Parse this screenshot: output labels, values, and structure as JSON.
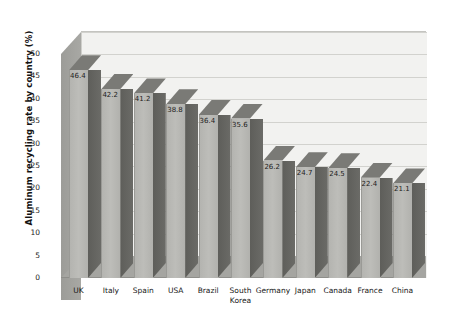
{
  "chart_data": {
    "type": "bar",
    "title": "",
    "xlabel": "",
    "ylabel": "Aluminum recycling rate by country (%)",
    "ylim": [
      0,
      50
    ],
    "yticks": [
      0,
      5,
      10,
      15,
      20,
      25,
      30,
      35,
      40,
      45,
      50
    ],
    "grid": true,
    "legend": false,
    "three_d": true,
    "categories": [
      "UK",
      "Italy",
      "Spain",
      "USA",
      "Brazil",
      "South Korea",
      "Germany",
      "Japan",
      "Canada",
      "France",
      "China"
    ],
    "values": [
      46.4,
      42.2,
      41.2,
      38.8,
      36.4,
      35.6,
      26.2,
      24.7,
      24.5,
      22.4,
      21.1
    ],
    "data_labels": [
      "46.4",
      "42.2",
      "41.2",
      "38.8",
      "36.4",
      "35.6",
      "26.2",
      "24.7",
      "24.5",
      "22.4",
      "21.1"
    ],
    "category_lines": [
      [
        "UK"
      ],
      [
        "Italy"
      ],
      [
        "Spain"
      ],
      [
        "USA"
      ],
      [
        "Brazil"
      ],
      [
        "South",
        "Korea"
      ],
      [
        "Germany"
      ],
      [
        "Japan"
      ],
      [
        "Canada"
      ],
      [
        "France"
      ],
      [
        "China"
      ]
    ],
    "colors": {
      "bar_face": "#b8b8b4",
      "bar_side": "#63635f",
      "bar_top": "#7a7a76",
      "back_wall": "#f2f2f0",
      "floor": "#a5a5a1",
      "gridline": "#d2d2ce",
      "text": "#1a1a1a",
      "background": "#ffffff"
    }
  }
}
